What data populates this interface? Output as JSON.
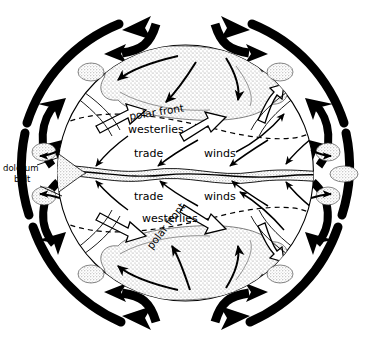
{
  "figure": {
    "type": "schematic-diagram",
    "background_color": "#ffffff",
    "ink_color": "#000000",
    "stipple_color": "#9a9a9a"
  },
  "labels": {
    "polar_front_north": "polar front",
    "westerlies_north": "westerlies",
    "trade_north": "trade",
    "winds_north": "winds",
    "trade_south": "trade",
    "winds_south": "winds",
    "westerlies_south": "westerlies",
    "polar_front_south": "polar front",
    "doldrum_line1": "doldrum",
    "doldrum_line2": "belt"
  },
  "regions": {
    "polar_air_mass_north": "northern polar air mass",
    "polar_air_mass_south": "southern polar air mass",
    "doldrum_belt_band": "equatorial doldrum belt",
    "globe": "earth disc"
  },
  "arrows": {
    "outer_cell_style": "thick-solid-black",
    "surface_wind_style": "thin-curved-black",
    "upper_air_style": "hollow-outline",
    "outer_cell_count": 12,
    "surface_wind_count": 14,
    "hollow_arrow_count": 8
  },
  "boundaries": {
    "polar_front_north_line": "dashed",
    "polar_front_south_line": "dashed",
    "equator_line": "stippled-wavy-band"
  }
}
